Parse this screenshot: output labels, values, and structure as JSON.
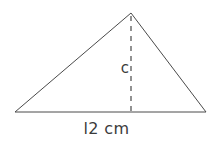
{
  "figure": {
    "type": "geometry-diagram",
    "shape": "triangle",
    "background_color": "#ffffff",
    "stroke_color": "#4a4a4a",
    "text_color": "#3b3b3b",
    "stroke_width": 1,
    "vertices": {
      "left": {
        "x": 15,
        "y": 112
      },
      "apex": {
        "x": 131,
        "y": 13
      },
      "right": {
        "x": 206,
        "y": 112
      }
    },
    "height_line": {
      "name": "altitude",
      "style": "dashed",
      "dash_length": 5,
      "gap_length": 5,
      "from": {
        "x": 131,
        "y": 16
      },
      "to": {
        "x": 131,
        "y": 112
      }
    },
    "labels": {
      "height": "c",
      "base": "l2 cm"
    }
  }
}
